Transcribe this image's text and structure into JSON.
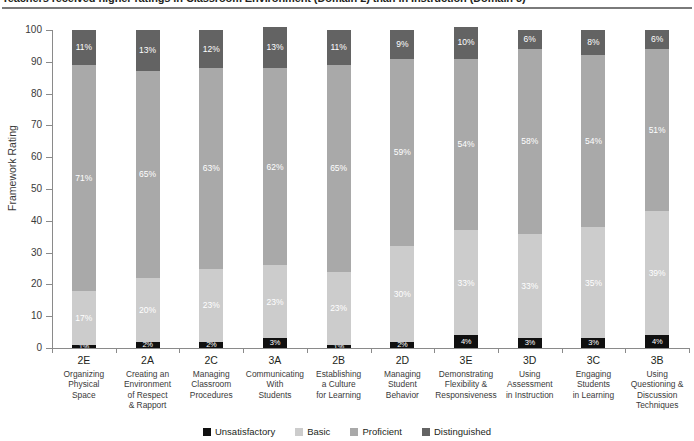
{
  "title": "Teachers received higher ratings in Classroom Environment (Domain 2) than in Instruction (Domain 3)",
  "colors": {
    "unsatisfactory": "#101010",
    "basic": "#cccccc",
    "proficient": "#a9a9a9",
    "distinguished": "#636363"
  },
  "chart_data": {
    "type": "bar",
    "title": "Teachers received higher ratings in Classroom Environment (Domain 2) than in Instruction (Domain 3)",
    "xlabel": "",
    "ylabel": "Framework Rating",
    "ylim": [
      0,
      100
    ],
    "yticks": [
      0,
      10,
      20,
      30,
      40,
      50,
      60,
      70,
      80,
      90,
      100
    ],
    "grid": false,
    "stacked": true,
    "legend_position": "bottom",
    "categories": [
      "2E",
      "2A",
      "2C",
      "3A",
      "2B",
      "2D",
      "3E",
      "3D",
      "3C",
      "3B"
    ],
    "category_names": [
      "Organizing Physical Space",
      "Creating an Environment of Respect & Rapport",
      "Managing Classroom Procedures",
      "Communicating With Students",
      "Establishing a Culture for Learning",
      "Managing Student Behavior",
      "Demonstrating Flexibility & Responsiveness",
      "Using Assessment in Instruction",
      "Engaging Students in Learning",
      "Using Questioning & Discussion Techniques"
    ],
    "category_name_lines": [
      [
        "Organizing",
        "Physical",
        "Space"
      ],
      [
        "Creating an",
        "Environment",
        "of Respect",
        "& Rapport"
      ],
      [
        "Managing",
        "Classroom",
        "Procedures"
      ],
      [
        "Communicating",
        "With",
        "Students"
      ],
      [
        "Establishing",
        "a Culture",
        "for Learning"
      ],
      [
        "Managing",
        "Student",
        "Behavior"
      ],
      [
        "Demonstrating",
        "Flexibility &",
        "Responsiveness"
      ],
      [
        "Using",
        "Assessment",
        "in Instruction"
      ],
      [
        "Engaging",
        "Students",
        "in Learning"
      ],
      [
        "Using",
        "Questioning &",
        "Discussion",
        "Techniques"
      ]
    ],
    "series": [
      {
        "name": "Unsatisfactory",
        "color": "#101010",
        "values": [
          1,
          2,
          2,
          3,
          1,
          2,
          4,
          3,
          3,
          4
        ]
      },
      {
        "name": "Basic",
        "color": "#cccccc",
        "values": [
          17,
          20,
          23,
          23,
          23,
          30,
          33,
          33,
          35,
          39
        ]
      },
      {
        "name": "Proficient",
        "color": "#a9a9a9",
        "values": [
          71,
          65,
          63,
          62,
          65,
          59,
          54,
          58,
          54,
          51
        ]
      },
      {
        "name": "Distinguished",
        "color": "#636363",
        "values": [
          11,
          13,
          12,
          13,
          11,
          9,
          10,
          6,
          8,
          6
        ]
      }
    ],
    "value_labels": [
      {
        "category": "2E",
        "unsatisfactory": "1%",
        "basic": "17%",
        "proficient": "71%",
        "distinguished": "11%"
      },
      {
        "category": "2A",
        "unsatisfactory": "2%",
        "basic": "20%",
        "proficient": "65%",
        "distinguished": "13%"
      },
      {
        "category": "2C",
        "unsatisfactory": "2%",
        "basic": "23%",
        "proficient": "63%",
        "distinguished": "12%"
      },
      {
        "category": "3A",
        "unsatisfactory": "3%",
        "basic": "23%",
        "proficient": "62%",
        "distinguished": "13%"
      },
      {
        "category": "2B",
        "unsatisfactory": "1%",
        "basic": "23%",
        "proficient": "65%",
        "distinguished": "11%"
      },
      {
        "category": "2D",
        "unsatisfactory": "2%",
        "basic": "30%",
        "proficient": "59%",
        "distinguished": "9%"
      },
      {
        "category": "3E",
        "unsatisfactory": "4%",
        "basic": "33%",
        "proficient": "54%",
        "distinguished": "10%"
      },
      {
        "category": "3D",
        "unsatisfactory": "3%",
        "basic": "33%",
        "proficient": "58%",
        "distinguished": "6%"
      },
      {
        "category": "3C",
        "unsatisfactory": "3%",
        "basic": "35%",
        "proficient": "54%",
        "distinguished": "8%"
      },
      {
        "category": "3B",
        "unsatisfactory": "4%",
        "basic": "39%",
        "proficient": "51%",
        "distinguished": "6%"
      }
    ],
    "legend": [
      "Unsatisfactory",
      "Basic",
      "Proficient",
      "Distinguished"
    ]
  }
}
